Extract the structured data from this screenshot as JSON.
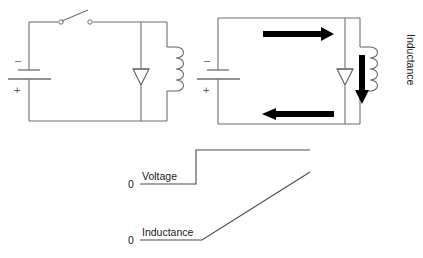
{
  "figure": {
    "background_color": "#ffffff",
    "wire_color": "#6e6e6e",
    "arrow_color": "#000000",
    "trace_color": "#4a4a4a",
    "text_color": "#1a1a1a"
  },
  "circuit_left": {
    "name": "switch-open-circuit",
    "battery": {
      "negative_sign": "–",
      "positive_sign": "+"
    },
    "switch": {
      "state": "open"
    },
    "diode": {
      "orientation": "cathode-up"
    },
    "inductor": {
      "coil_turns": 4
    }
  },
  "circuit_right": {
    "name": "switch-closed-circuit",
    "battery": {
      "negative_sign": "–",
      "positive_sign": "+"
    },
    "diode": {
      "orientation": "cathode-up"
    },
    "inductor": {
      "coil_turns": 4,
      "label": "Inductance"
    },
    "current_arrows": [
      {
        "name": "top-current-arrow",
        "direction": "right"
      },
      {
        "name": "bottom-current-arrow",
        "direction": "left"
      },
      {
        "name": "inductor-current-arrow",
        "direction": "down"
      }
    ]
  },
  "waveforms": {
    "voltage": {
      "label": "Voltage",
      "zero_label": "0",
      "shape": "step"
    },
    "inductance": {
      "label": "Inductance",
      "zero_label": "0",
      "shape": "ramp"
    }
  }
}
